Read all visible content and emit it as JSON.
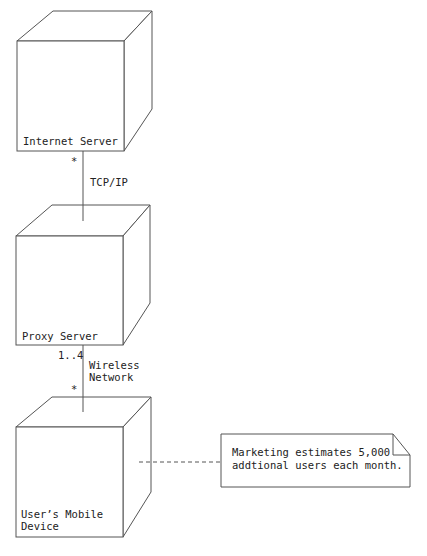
{
  "diagram": {
    "type": "UML deployment diagram",
    "nodes": [
      {
        "id": "internet-server",
        "label_lines": [
          "Internet Server"
        ]
      },
      {
        "id": "proxy-server",
        "label_lines": [
          "Proxy Server"
        ]
      },
      {
        "id": "mobile-device",
        "label_lines": [
          "User’s Mobile",
          "Device"
        ]
      }
    ],
    "links": [
      {
        "from": "internet-server",
        "to": "proxy-server",
        "label_lines": [
          "TCP/IP"
        ],
        "from_multiplicity": "*",
        "to_multiplicity": ""
      },
      {
        "from": "proxy-server",
        "to": "mobile-device",
        "label_lines": [
          "Wireless",
          "Network"
        ],
        "from_multiplicity": "1..4",
        "to_multiplicity": "*"
      }
    ],
    "note": {
      "attached_to": "mobile-device",
      "text_lines": [
        "Marketing estimates 5,000",
        "addtional users each month."
      ]
    },
    "colors": {
      "stroke": "#555555",
      "text": "#222222",
      "background": "#ffffff"
    }
  }
}
